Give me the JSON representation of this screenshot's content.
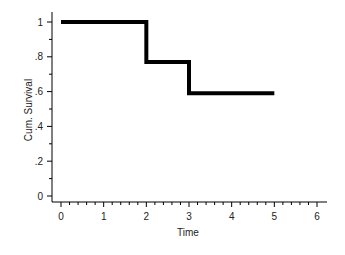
{
  "chart_data": {
    "type": "line",
    "subtype": "step",
    "title": "",
    "xlabel": "Time",
    "ylabel": "Cum. Survival",
    "xlim": [
      -0.15,
      6.2
    ],
    "ylim": [
      -0.05,
      1.05
    ],
    "x_ticks": [
      0,
      1,
      2,
      3,
      4,
      5,
      6
    ],
    "x_tick_labels": [
      "0",
      "1",
      "2",
      "3",
      "4",
      "5",
      "6"
    ],
    "y_ticks": [
      0,
      0.2,
      0.4,
      0.6,
      0.8,
      1
    ],
    "y_tick_labels": [
      "0",
      ".2",
      ".4",
      ".6",
      ".8",
      "1"
    ],
    "grid": false,
    "legend": null,
    "series": [
      {
        "name": "Cum. Survival",
        "color": "#000000",
        "x": [
          0,
          2,
          2,
          3,
          3,
          5
        ],
        "y": [
          1.0,
          1.0,
          0.77,
          0.77,
          0.59,
          0.59
        ]
      }
    ]
  }
}
